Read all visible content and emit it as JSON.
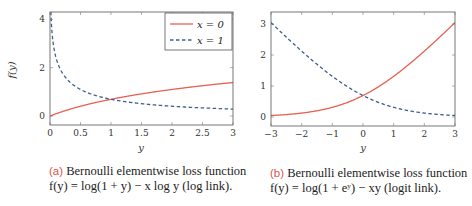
{
  "chart_data": [
    {
      "type": "line",
      "panel": "a",
      "title": "",
      "xlabel": "y",
      "ylabel": "f(y)",
      "xlim": [
        0,
        3
      ],
      "ylim": [
        -0.37,
        4.3
      ],
      "xticks": [
        "0",
        "0.5",
        "1",
        "1.5",
        "2",
        "2.5",
        "3"
      ],
      "yticks": [
        "0",
        "2",
        "4"
      ],
      "grid": false,
      "legend_position": "upper right",
      "series": [
        {
          "name": "x = 0",
          "style": "solid",
          "color": "#e8604f",
          "formula": "log(1+y)",
          "x": [
            0,
            0.5,
            1,
            1.5,
            2,
            2.5,
            3
          ],
          "values": [
            0,
            0.41,
            0.69,
            0.92,
            1.1,
            1.25,
            1.39
          ]
        },
        {
          "name": "x = 1",
          "style": "dashed",
          "color": "#3f5f8f",
          "formula": "log(1+y) - log(y)",
          "x": [
            0.01,
            0.1,
            0.25,
            0.5,
            1,
            1.5,
            2,
            2.5,
            3
          ],
          "values": [
            4.62,
            2.4,
            1.61,
            1.1,
            0.69,
            0.51,
            0.41,
            0.34,
            0.29
          ]
        }
      ]
    },
    {
      "type": "line",
      "panel": "b",
      "title": "",
      "xlabel": "y",
      "ylabel": "",
      "xlim": [
        -3,
        3
      ],
      "ylim": [
        -0.29,
        3.39
      ],
      "xticks": [
        "−3",
        "−2",
        "−1",
        "0",
        "1",
        "2",
        "3"
      ],
      "yticks": [
        "0",
        "1",
        "2",
        "3"
      ],
      "grid": false,
      "series": [
        {
          "name": "x = 0",
          "style": "solid",
          "color": "#e8604f",
          "formula": "log(1+e^y)",
          "x": [
            -3,
            -2,
            -1,
            0,
            1,
            2,
            3
          ],
          "values": [
            0.05,
            0.13,
            0.31,
            0.69,
            1.31,
            2.13,
            3.05
          ]
        },
        {
          "name": "x = 1",
          "style": "dashed",
          "color": "#3f5f8f",
          "formula": "log(1+e^y) - y",
          "x": [
            -3,
            -2,
            -1,
            0,
            1,
            2,
            3
          ],
          "values": [
            3.05,
            2.13,
            1.31,
            0.69,
            0.31,
            0.13,
            0.05
          ]
        }
      ]
    }
  ],
  "panels": {
    "a": {
      "ylabel": "f(y)",
      "xlabel": "y",
      "legend": [
        {
          "label": "x = 0"
        },
        {
          "label": "x = 1"
        }
      ],
      "caption_tag": "(a)",
      "caption_line1": "Bernoulli elementwise loss function",
      "caption_line2": "f(y) = log(1 + y) − x log y (log link)."
    },
    "b": {
      "xlabel": "y",
      "caption_tag": "(b)",
      "caption_line1": "Bernoulli elementwise loss function",
      "caption_line2": "f(y) = log(1 + eʸ) − xy (logit link)."
    }
  },
  "colors": {
    "red": "#e8604f",
    "blue": "#3f5f8f",
    "frame": "#555555"
  }
}
